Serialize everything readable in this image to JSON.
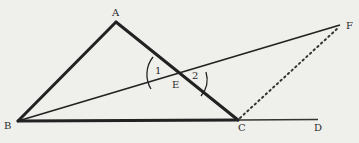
{
  "diagram": {
    "type": "geometry",
    "background": "#efefec",
    "stroke_color": "#222222",
    "points": {
      "A": {
        "label": "A",
        "x": 116,
        "y": 22
      },
      "B": {
        "label": "B",
        "x": 18,
        "y": 121
      },
      "C": {
        "label": "C",
        "x": 238,
        "y": 120
      },
      "D": {
        "label": "D",
        "x": 318,
        "y": 120
      },
      "E": {
        "label": "E",
        "x": 181,
        "y": 80
      },
      "F": {
        "label": "F",
        "x": 340,
        "y": 25
      }
    },
    "segments": [
      {
        "from": "A",
        "to": "B",
        "style": "thick"
      },
      {
        "from": "A",
        "to": "C",
        "style": "thick"
      },
      {
        "from": "B",
        "to": "C",
        "style": "thick"
      },
      {
        "from": "C",
        "to": "D",
        "style": "thin"
      },
      {
        "from": "B",
        "to": "F",
        "style": "thin"
      },
      {
        "from": "C",
        "to": "F",
        "style": "dotted"
      }
    ],
    "angles": [
      {
        "label": "1",
        "vertex": "E",
        "side": "left"
      },
      {
        "label": "2",
        "vertex": "E",
        "side": "right"
      }
    ]
  }
}
